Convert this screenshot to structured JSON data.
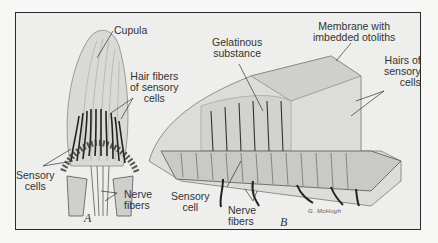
{
  "figure": {
    "panels": [
      {
        "id": "A",
        "label": "A",
        "structure": "crista ampullaris with cupula",
        "labels": {
          "cupula": "Cupula",
          "hair_fibers": [
            "Hair fibers",
            "of sensory",
            "cells"
          ],
          "sensory_cells": [
            "Sensory",
            "cells"
          ],
          "nerve_fibers": [
            "Nerve",
            "fibers"
          ]
        }
      },
      {
        "id": "B",
        "label": "B",
        "structure": "macula with otolithic membrane",
        "labels": {
          "gelatinous": [
            "Gelatinous",
            "substance"
          ],
          "membrane": [
            "Membrane with",
            "imbedded otoliths"
          ],
          "hairs": [
            "Hairs of",
            "sensory",
            "cells"
          ],
          "sensory_cell": [
            "Sensory",
            "cell"
          ],
          "nerve_fibers": [
            "Nerve",
            "fibers"
          ]
        }
      }
    ],
    "signature": "G. McHugh",
    "colors": {
      "background": "#eeeeec",
      "frame": "#2a2a2a",
      "ink": "#333333"
    }
  }
}
